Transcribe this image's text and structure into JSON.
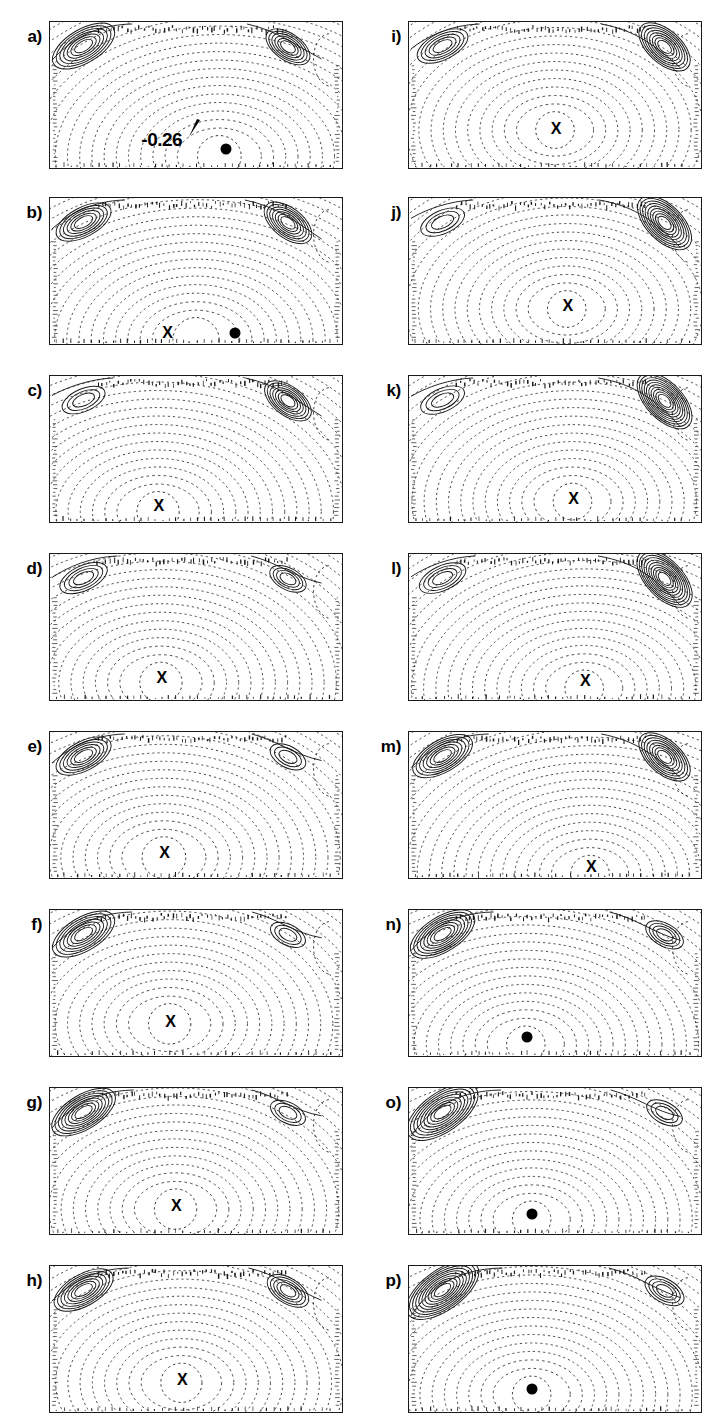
{
  "figure": {
    "type": "contour-panel-grid",
    "rows": 8,
    "columns": 2,
    "panel_count": 16,
    "background_color": "#ffffff",
    "line_color": "#1a1a1a",
    "frame_color": "#1a1a1a"
  },
  "chart_data": {
    "type": "contour",
    "title": "",
    "xlabel": "",
    "ylabel": "",
    "contour_styles": {
      "positive": "solid",
      "negative": "dotted",
      "zero": "solid"
    },
    "marker_legend": {
      "x": "X marks the location of the primary extremum",
      "dot": "filled circle marks the location of the primary extremum"
    },
    "labeled_contours": [
      {
        "panel": "a",
        "value": "-0.26"
      }
    ],
    "panels": [
      {
        "id": "a",
        "label": "a)",
        "column": "left",
        "row": 1,
        "marker": "dot",
        "marker_x": 0.6,
        "marker_y": 0.86,
        "contour_label": "-0.26",
        "contour_label_x": 0.38,
        "contour_label_y": 0.8,
        "pointer_x": 0.49,
        "pointer_y": 0.73,
        "core_x": 0.58,
        "core_y": 0.92,
        "core_r": 0.34,
        "left_vortex": 0.58,
        "right_vortex": 0.42,
        "bands": 22
      },
      {
        "id": "b",
        "label": "b)",
        "column": "left",
        "row": 2,
        "marker": "both",
        "marker_x": 0.63,
        "marker_y": 0.91,
        "marker2": "x",
        "marker2_x": 0.4,
        "marker2_y": 0.91,
        "core_x": 0.5,
        "core_y": 0.97,
        "core_r": 0.36,
        "left_vortex": 0.4,
        "right_vortex": 0.55,
        "bands": 22
      },
      {
        "id": "c",
        "label": "c)",
        "column": "left",
        "row": 3,
        "marker": "x",
        "marker_x": 0.37,
        "marker_y": 0.88,
        "core_x": 0.37,
        "core_y": 0.93,
        "core_r": 0.33,
        "left_vortex": 0.12,
        "right_vortex": 0.52,
        "bands": 22
      },
      {
        "id": "d",
        "label": "d)",
        "column": "left",
        "row": 4,
        "marker": "x",
        "marker_x": 0.38,
        "marker_y": 0.84,
        "core_x": 0.38,
        "core_y": 0.88,
        "core_r": 0.33,
        "left_vortex": 0.22,
        "right_vortex": 0.18,
        "bands": 22
      },
      {
        "id": "e",
        "label": "e)",
        "column": "left",
        "row": 5,
        "marker": "x",
        "marker_x": 0.39,
        "marker_y": 0.82,
        "core_x": 0.39,
        "core_y": 0.86,
        "core_r": 0.34,
        "left_vortex": 0.4,
        "right_vortex": 0.16,
        "bands": 22
      },
      {
        "id": "f",
        "label": "f)",
        "column": "left",
        "row": 6,
        "marker": "x",
        "marker_x": 0.41,
        "marker_y": 0.76,
        "core_x": 0.41,
        "core_y": 0.78,
        "core_r": 0.33,
        "left_vortex": 0.58,
        "right_vortex": 0.14,
        "bands": 22
      },
      {
        "id": "g",
        "label": "g)",
        "column": "left",
        "row": 7,
        "marker": "x",
        "marker_x": 0.43,
        "marker_y": 0.8,
        "core_x": 0.43,
        "core_y": 0.83,
        "core_r": 0.33,
        "left_vortex": 0.62,
        "right_vortex": 0.14,
        "bands": 22
      },
      {
        "id": "h",
        "label": "h)",
        "column": "left",
        "row": 8,
        "marker": "x",
        "marker_x": 0.45,
        "marker_y": 0.77,
        "core_x": 0.45,
        "core_y": 0.8,
        "core_r": 0.32,
        "left_vortex": 0.5,
        "right_vortex": 0.34,
        "bands": 22
      },
      {
        "id": "i",
        "label": "i)",
        "column": "right",
        "row": 1,
        "marker": "x",
        "marker_x": 0.5,
        "marker_y": 0.72,
        "core_x": 0.5,
        "core_y": 0.74,
        "core_r": 0.3,
        "left_vortex": 0.3,
        "right_vortex": 0.7,
        "bands": 22
      },
      {
        "id": "j",
        "label": "j)",
        "column": "right",
        "row": 2,
        "marker": "x",
        "marker_x": 0.54,
        "marker_y": 0.73,
        "core_x": 0.54,
        "core_y": 0.76,
        "core_r": 0.3,
        "left_vortex": 0.14,
        "right_vortex": 0.82,
        "bands": 22
      },
      {
        "id": "k",
        "label": "k)",
        "column": "right",
        "row": 3,
        "marker": "x",
        "marker_x": 0.56,
        "marker_y": 0.83,
        "core_x": 0.56,
        "core_y": 0.86,
        "core_r": 0.3,
        "left_vortex": 0.14,
        "right_vortex": 0.86,
        "bands": 22
      },
      {
        "id": "l",
        "label": "l)",
        "column": "right",
        "row": 4,
        "marker": "x",
        "marker_x": 0.6,
        "marker_y": 0.86,
        "core_x": 0.6,
        "core_y": 0.92,
        "core_r": 0.3,
        "left_vortex": 0.2,
        "right_vortex": 0.88,
        "bands": 22
      },
      {
        "id": "m",
        "label": "m)",
        "column": "right",
        "row": 5,
        "marker": "x",
        "marker_x": 0.62,
        "marker_y": 0.91,
        "core_x": 0.62,
        "core_y": 0.97,
        "core_r": 0.3,
        "left_vortex": 0.52,
        "right_vortex": 0.7,
        "bands": 22
      },
      {
        "id": "n",
        "label": "n)",
        "column": "right",
        "row": 6,
        "marker": "dot",
        "marker_x": 0.4,
        "marker_y": 0.86,
        "core_x": 0.4,
        "core_y": 0.92,
        "core_r": 0.3,
        "left_vortex": 0.64,
        "right_vortex": 0.22,
        "bands": 22
      },
      {
        "id": "o",
        "label": "o)",
        "column": "right",
        "row": 7,
        "marker": "dot",
        "marker_x": 0.42,
        "marker_y": 0.85,
        "core_x": 0.42,
        "core_y": 0.9,
        "core_r": 0.3,
        "left_vortex": 0.82,
        "right_vortex": 0.16,
        "bands": 22
      },
      {
        "id": "p",
        "label": "p)",
        "column": "right",
        "row": 8,
        "marker": "dot",
        "marker_x": 0.42,
        "marker_y": 0.83,
        "core_x": 0.42,
        "core_y": 0.88,
        "core_r": 0.3,
        "left_vortex": 0.86,
        "right_vortex": 0.26,
        "bands": 22
      }
    ]
  },
  "markers": {
    "x_glyph": "X",
    "dot_glyph": "●"
  }
}
